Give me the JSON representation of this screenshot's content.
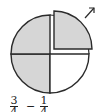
{
  "diagram": {
    "quarters_total": 4,
    "quarters_shaded": 3,
    "quarter_removed": 1,
    "colors": {
      "shade": "#d6d6d6",
      "stroke": "#2b2b2b",
      "background": "#ffffff"
    },
    "arrow": "arrow-up-right"
  },
  "expression": {
    "left": {
      "numerator": "3",
      "denominator": "4"
    },
    "operator": "−",
    "right": {
      "numerator": "1",
      "denominator": "4"
    }
  }
}
